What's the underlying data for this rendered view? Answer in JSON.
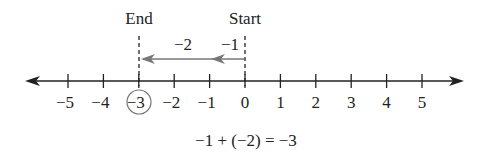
{
  "diagram": {
    "type": "number-line",
    "tick_labels": [
      "−5",
      "−4",
      "−3",
      "−2",
      "−1",
      "0",
      "1",
      "2",
      "3",
      "4",
      "5"
    ],
    "tick_values": [
      -5,
      -4,
      -3,
      -2,
      -1,
      0,
      1,
      2,
      3,
      4,
      5
    ],
    "circled_value": -3,
    "markers": {
      "start": {
        "label": "Start",
        "value": 0
      },
      "end": {
        "label": "End",
        "value": -3
      }
    },
    "moves": [
      {
        "label": "−1",
        "from": 0,
        "to": -1
      },
      {
        "label": "−2",
        "from": -1,
        "to": -3
      }
    ],
    "equation": "−1 + (−2) = −3",
    "colors": {
      "axis": "#222222",
      "move_arrow": "#777777",
      "circle": "#777777"
    }
  }
}
